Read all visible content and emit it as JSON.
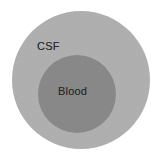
{
  "figure": {
    "type": "nested-circles-diagram",
    "background_color": "#ffffff",
    "width": 162,
    "height": 156
  },
  "regions": [
    {
      "key": "csf",
      "label": "CSF",
      "shape": "circle",
      "fill_color": "#b1b1b1",
      "center_x": 81,
      "center_y": 80,
      "radius": 69,
      "label_x": 37,
      "label_y": 40
    },
    {
      "key": "blood",
      "label": "Blood",
      "shape": "circle",
      "fill_color": "#8a8a8a",
      "center_x": 77,
      "center_y": 94,
      "radius": 39,
      "label_x": 58,
      "label_y": 85
    }
  ],
  "labels": {
    "outer": "CSF",
    "inner": "Blood"
  },
  "colors": {
    "background": "#ffffff",
    "outer_fill": "#b1b1b1",
    "inner_fill": "#8a8a8a",
    "text": "#2a2a2a"
  }
}
